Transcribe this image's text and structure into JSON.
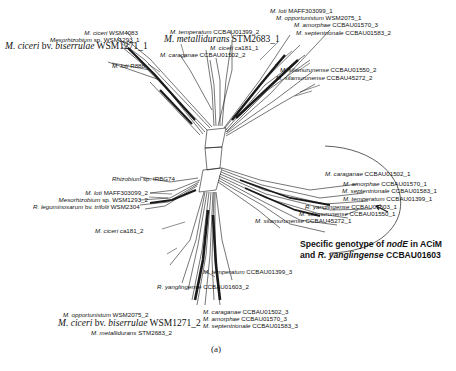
{
  "figure": {
    "panel_label": "(a)",
    "type": "splits-network (NeighborNet) of nodE genotypes"
  },
  "labels": {
    "top_left": [
      {
        "genus": "M.",
        "species": "ciceri",
        "strain": "WSM4083"
      },
      {
        "genus": "Mesorhizobium",
        "species": "sp.",
        "strain": "WSM1293_1"
      },
      {
        "genus": "M.",
        "species": "ciceri",
        "extra": "bv.",
        "biovar": "biserrulae",
        "strain": "WSM1271_1"
      },
      {
        "genus": "M.",
        "species": "loti",
        "strain": "R88b"
      }
    ],
    "top_center": [
      {
        "genus": "M.",
        "species": "temperatum",
        "strain": "CCBAU01399_2"
      },
      {
        "genus": "M.",
        "species": "metallidurans",
        "strain": "STM2683_1"
      },
      {
        "genus": "M.",
        "species": "ciceri",
        "strain": "ca181_1"
      },
      {
        "genus": "M.",
        "species": "caraganae",
        "strain": "CCBAU01502_2"
      }
    ],
    "top_right": [
      {
        "genus": "M.",
        "species": "loti",
        "strain": "MAFF303099_1"
      },
      {
        "genus": "M.",
        "species": "opportunistum",
        "strain": "WSM2075_1"
      },
      {
        "genus": "M.",
        "species": "amorphae",
        "strain": "CCBAU01570_3"
      },
      {
        "genus": "M.",
        "species": "septentrionale",
        "strain": "CCBAU01583_2"
      },
      {
        "genus": "M.",
        "species": "silamurunense",
        "strain": "CCBAU01550_2"
      },
      {
        "genus": "M.",
        "species": "silamurunense",
        "strain": "CCBAU45272_2"
      }
    ],
    "middle_left": [
      {
        "genus": "Rhizobium",
        "species": "sp.",
        "strain": "IRBG74"
      },
      {
        "genus": "M.",
        "species": "loti",
        "strain": "MAFF303099_2"
      },
      {
        "genus": "Mesorhizobium",
        "species": "sp.",
        "strain": "WSM1293_2"
      },
      {
        "genus": "R.",
        "species": "leguminosarum",
        "extra": "bv.",
        "biovar": "trifolii",
        "strain": "WSM2304"
      }
    ],
    "right_cluster": [
      {
        "genus": "M.",
        "species": "caraganae",
        "strain": "CCBAU01502_1"
      },
      {
        "genus": "M.",
        "species": "amorphae",
        "strain": "CCBAU01570_1"
      },
      {
        "genus": "M.",
        "species": "septentrionale",
        "strain": "CCBAU01583_1"
      },
      {
        "genus": "M.",
        "species": "temperatum",
        "strain": "CCBAU01399_1"
      },
      {
        "genus": "R.",
        "species": "yanglingense",
        "strain": "CCBAU01603_1"
      },
      {
        "genus": "M.",
        "species": "silamurunense",
        "strain": "CCBAU01550_1"
      },
      {
        "genus": "M.",
        "species": "silamurunense",
        "strain": "CCBAU45272_1"
      }
    ],
    "bottom": [
      {
        "genus": "M.",
        "species": "ciceri",
        "strain": "ca181_2"
      },
      {
        "genus": "M.",
        "species": "temperatum",
        "strain": "CCBAU01399_3"
      },
      {
        "genus": "R.",
        "species": "yanglingense",
        "strain": "CCBAU01603_2"
      },
      {
        "genus": "M.",
        "species": "caraganae",
        "strain": "CCBAU01502_3"
      },
      {
        "genus": "M.",
        "species": "amorphae",
        "strain": "CCBAU01570_3"
      },
      {
        "genus": "M.",
        "species": "septentrionale",
        "strain": "CCBAU01583_3"
      },
      {
        "genus": "M.",
        "species": "opportunistum",
        "strain": "WSM2075_2"
      },
      {
        "genus": "M.",
        "species": "ciceri",
        "extra": "bv.",
        "biovar": "biserrulae",
        "strain": "WSM1271_2"
      },
      {
        "genus": "M.",
        "species": "metallidurans",
        "strain": "STM2683_2"
      }
    ]
  },
  "callout": {
    "line1_a": "Specific genotype of ",
    "line1_b": "nodE",
    "line1_c": " in ACiM",
    "line2_a": "and ",
    "line2_b": "R. yanglingense",
    "line2_c": " CCBAU01603"
  },
  "colors": {
    "ink": "#111111",
    "lines": "#1a1a1a",
    "background": "#ffffff"
  }
}
